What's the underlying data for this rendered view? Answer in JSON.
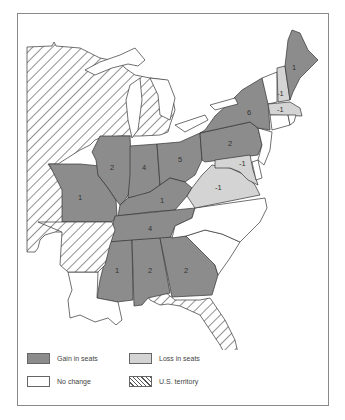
{
  "map": {
    "colors": {
      "gain": "#8c8c8c",
      "loss": "#d4d4d4",
      "no_change": "#ffffff",
      "territory_hatch": "#555555",
      "border": "#333333"
    },
    "state_labels": [
      {
        "state": "Maine",
        "value": "1",
        "category": "gain"
      },
      {
        "state": "New Hampshire",
        "value": "-1",
        "category": "loss"
      },
      {
        "state": "Massachusetts",
        "value": "-1",
        "category": "loss"
      },
      {
        "state": "New York",
        "value": "6",
        "category": "gain"
      },
      {
        "state": "Pennsylvania",
        "value": "2",
        "category": "gain"
      },
      {
        "state": "Maryland",
        "value": "-1",
        "category": "loss"
      },
      {
        "state": "Virginia",
        "value": "-1",
        "category": "loss"
      },
      {
        "state": "Ohio",
        "value": "5",
        "category": "gain"
      },
      {
        "state": "Indiana",
        "value": "4",
        "category": "gain"
      },
      {
        "state": "Illinois",
        "value": "2",
        "category": "gain"
      },
      {
        "state": "Missouri",
        "value": "1",
        "category": "gain"
      },
      {
        "state": "Kentucky",
        "value": "1",
        "category": "gain"
      },
      {
        "state": "Tennessee",
        "value": "4",
        "category": "gain"
      },
      {
        "state": "Mississippi",
        "value": "1",
        "category": "gain"
      },
      {
        "state": "Alabama",
        "value": "2",
        "category": "gain"
      },
      {
        "state": "Georgia",
        "value": "2",
        "category": "gain"
      }
    ]
  },
  "legend": {
    "gain": "Gain in seats",
    "loss": "Loss in seats",
    "no_change": "No change",
    "territory": "U.S. territory"
  }
}
